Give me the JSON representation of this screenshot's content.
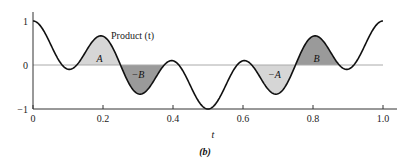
{
  "chart_data": {
    "type": "line",
    "title": "",
    "curve_label": "Product (t)",
    "function": "cos(4*pi*t)*cos(6*pi*t)",
    "xlabel": "t",
    "ylabel": "",
    "caption": "(b)",
    "xlim": [
      0,
      1.0
    ],
    "ylim": [
      -1,
      1
    ],
    "x_ticks": [
      "0",
      "0.2",
      "0.4",
      "0.6",
      "0.8",
      "1.0"
    ],
    "y_ticks": [
      "1",
      "0",
      "−1"
    ],
    "x": [
      0,
      0.1,
      0.2,
      0.3,
      0.4,
      0.5,
      0.6,
      0.7,
      0.8,
      0.9,
      1.0
    ],
    "values": [
      1,
      -0.095,
      0.655,
      -0.655,
      0.095,
      -1,
      0.095,
      -0.655,
      0.655,
      -0.095,
      1
    ],
    "shaded_regions": [
      {
        "label": "A",
        "from": 0.125,
        "to": 0.25,
        "shade": "light"
      },
      {
        "label": "−B",
        "from": 0.25,
        "to": 0.375,
        "shade": "dark"
      },
      {
        "label": "−A",
        "from": 0.625,
        "to": 0.75,
        "shade": "light"
      },
      {
        "label": "B",
        "from": 0.75,
        "to": 0.875,
        "shade": "dark"
      }
    ],
    "grid": false,
    "zero_line": true
  },
  "colors": {
    "light": "#d6d6d6",
    "dark": "#9a9a9a",
    "curve": "#111111",
    "axis": "#333333",
    "zero": "#aaaaaa"
  }
}
